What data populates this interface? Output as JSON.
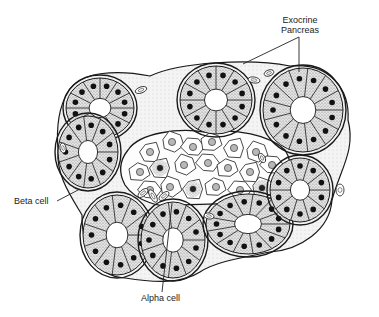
{
  "figure": {
    "type": "histology illustration",
    "colors": {
      "ink": "#1a1a1a",
      "stipple": "#9a9a9a",
      "nucleus": "#111111",
      "islet_nucleus": "#b8b8b8",
      "background": "#ffffff"
    }
  },
  "labels": {
    "exocrine_line1": "Exocrine",
    "exocrine_line2": "Pancreas",
    "beta_cell": "Beta cell",
    "alpha_cell": "Alpha cell"
  },
  "leaders": [
    {
      "name": "exocrine-leader-a",
      "x1": 299,
      "y1": 37,
      "x2": 243,
      "y2": 64
    },
    {
      "name": "exocrine-leader-b",
      "x1": 299,
      "y1": 37,
      "x2": 299,
      "y2": 72
    },
    {
      "name": "beta-cell-leader",
      "x1": 57,
      "y1": 201,
      "x2": 80,
      "y2": 189
    },
    {
      "name": "alpha-cell-leader",
      "x1": 162,
      "y1": 292,
      "x2": 172,
      "y2": 203
    }
  ],
  "acini": [
    {
      "cx": 100,
      "cy": 108,
      "rx": 34,
      "ry": 30,
      "cells": 12
    },
    {
      "cx": 216,
      "cy": 100,
      "rx": 36,
      "ry": 34,
      "cells": 12
    },
    {
      "cx": 303,
      "cy": 110,
      "rx": 40,
      "ry": 42,
      "cells": 13
    },
    {
      "cx": 88,
      "cy": 152,
      "rx": 30,
      "ry": 36,
      "cells": 11
    },
    {
      "cx": 117,
      "cy": 235,
      "rx": 34,
      "ry": 40,
      "cells": 11
    },
    {
      "cx": 173,
      "cy": 240,
      "rx": 32,
      "ry": 38,
      "cells": 11
    },
    {
      "cx": 248,
      "cy": 224,
      "rx": 42,
      "ry": 30,
      "cells": 13
    },
    {
      "cx": 300,
      "cy": 190,
      "rx": 30,
      "ry": 32,
      "cells": 10
    }
  ],
  "islet": {
    "outline": "M128,150 C140,132 180,128 205,132 C235,128 270,135 285,150 C295,165 290,190 270,198 C240,206 205,203 185,205 C160,210 135,200 125,185 C118,172 120,160 128,150 Z",
    "cells": [
      {
        "x": 150,
        "y": 152
      },
      {
        "x": 172,
        "y": 142
      },
      {
        "x": 193,
        "y": 147
      },
      {
        "x": 212,
        "y": 142
      },
      {
        "x": 234,
        "y": 148
      },
      {
        "x": 256,
        "y": 152
      },
      {
        "x": 272,
        "y": 165
      },
      {
        "x": 140,
        "y": 172
      },
      {
        "x": 160,
        "y": 168
      },
      {
        "x": 184,
        "y": 165
      },
      {
        "x": 208,
        "y": 163
      },
      {
        "x": 228,
        "y": 168
      },
      {
        "x": 250,
        "y": 172
      },
      {
        "x": 262,
        "y": 188
      },
      {
        "x": 240,
        "y": 190
      },
      {
        "x": 216,
        "y": 187
      },
      {
        "x": 193,
        "y": 189
      },
      {
        "x": 170,
        "y": 187
      },
      {
        "x": 150,
        "y": 190
      }
    ],
    "dark_cells": [
      {
        "x": 160,
        "y": 168
      },
      {
        "x": 193,
        "y": 189
      },
      {
        "x": 262,
        "y": 188
      }
    ]
  },
  "capillaries": [
    {
      "x": 141,
      "y": 90,
      "rx": 6,
      "ry": 3,
      "rot": -20
    },
    {
      "x": 254,
      "y": 80,
      "rx": 6,
      "ry": 3,
      "rot": 10
    },
    {
      "x": 262,
      "y": 158,
      "rx": 5,
      "ry": 3,
      "rot": 60
    },
    {
      "x": 143,
      "y": 193,
      "rx": 6,
      "ry": 3,
      "rot": -40
    },
    {
      "x": 153,
      "y": 196,
      "rx": 7,
      "ry": 3,
      "rot": 60
    },
    {
      "x": 164,
      "y": 196,
      "rx": 6,
      "ry": 3,
      "rot": -40
    },
    {
      "x": 269,
      "y": 73,
      "rx": 5,
      "ry": 3,
      "rot": -20
    },
    {
      "x": 63,
      "y": 148,
      "rx": 5,
      "ry": 3,
      "rot": 80
    },
    {
      "x": 209,
      "y": 216,
      "rx": 5,
      "ry": 3,
      "rot": 10
    },
    {
      "x": 340,
      "y": 190,
      "rx": 4,
      "ry": 6,
      "rot": 0
    }
  ]
}
